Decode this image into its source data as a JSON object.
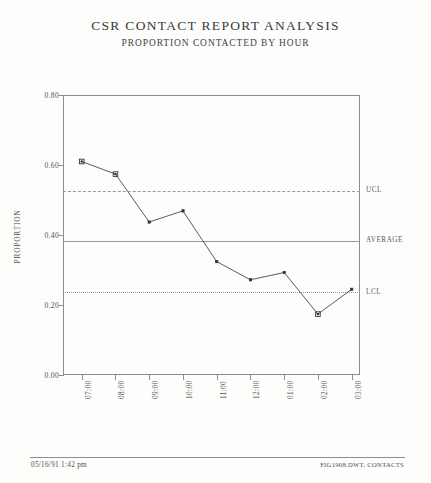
{
  "document": {
    "title": "CSR CONTACT REPORT ANALYSIS",
    "subtitle": "PROPORTION CONTACTED BY HOUR"
  },
  "footer": {
    "left": "05/16/91  1:42 pm",
    "right": "FIG1908.DWT, CONTACTS"
  },
  "chart_data": {
    "type": "line",
    "title": "CSR CONTACT REPORT ANALYSIS",
    "subtitle": "PROPORTION CONTACTED BY HOUR",
    "xlabel": "",
    "ylabel": "PROPORTION",
    "ylim": [
      0.0,
      0.8
    ],
    "ytick_labels": [
      "0.00",
      "0.20",
      "0.40",
      "0.60",
      "0.80"
    ],
    "yticks": [
      0.0,
      0.2,
      0.4,
      0.6,
      0.8
    ],
    "grid": false,
    "legend_position": "right-outside",
    "categories": [
      "07:00",
      "08:00",
      "09:00",
      "10:00",
      "11:00",
      "12:00",
      "01:00",
      "02:00",
      "03:00"
    ],
    "values": [
      0.61,
      0.574,
      0.437,
      0.469,
      0.324,
      0.272,
      0.293,
      0.174,
      0.245
    ],
    "marker": "square",
    "out_of_control_points": [
      0,
      1,
      7
    ],
    "control_lines": [
      {
        "name": "UCL",
        "label": "UCL",
        "value": 0.526,
        "style": "dashed"
      },
      {
        "name": "AVERAGE",
        "label": "AVERAGE",
        "value": 0.383,
        "style": "solid"
      },
      {
        "name": "LCL",
        "label": "LCL",
        "value": 0.237,
        "style": "dotted"
      }
    ],
    "series": [
      {
        "name": "PROPORTION",
        "values": [
          0.61,
          0.574,
          0.437,
          0.469,
          0.324,
          0.272,
          0.293,
          0.174,
          0.245
        ]
      }
    ],
    "colors": {
      "line": "#4a4a4a",
      "marker": "#333333",
      "frame": "#8d8d8d",
      "control": "#9a9a9a",
      "text": "#4d4d4d"
    }
  }
}
